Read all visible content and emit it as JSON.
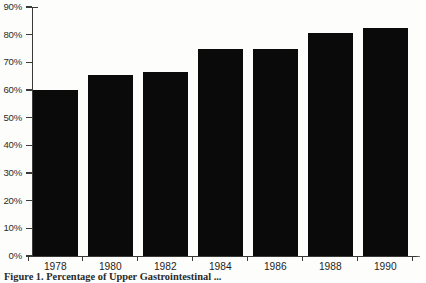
{
  "figure": {
    "caption_label": "Figure 1.",
    "caption_text": "Percentage of Upper Gastrointestinal ... ",
    "caption_full": "Figure 1.  Percentage of Upper Gastrointestinal"
  },
  "chart_data": {
    "type": "bar",
    "title": "",
    "xlabel": "",
    "ylabel": "",
    "categories": [
      "1978",
      "1980",
      "1982",
      "1984",
      "1986",
      "1988",
      "1990"
    ],
    "values": [
      60,
      65.5,
      66.5,
      75,
      75,
      80.5,
      82.5
    ],
    "value_labels": [
      "60%",
      "65.5%",
      "66.5%",
      "75%",
      "75%",
      "80.5%",
      "82.5%"
    ],
    "ylim": [
      0,
      90
    ],
    "ytick_values": [
      0,
      10,
      20,
      30,
      40,
      50,
      60,
      70,
      80,
      90
    ],
    "ytick_labels": [
      "0%",
      "10%",
      "20%",
      "30%",
      "40%",
      "50%",
      "60%",
      "70%",
      "80%",
      "90%"
    ],
    "grid": false,
    "legend": null,
    "legend_position": "none",
    "series": [
      {
        "name": "percentage",
        "values": [
          60,
          65.5,
          66.5,
          75,
          75,
          80.5,
          82.5
        ]
      }
    ],
    "bar_color": "#0a0a0a",
    "axis_color": "#3a3a38",
    "background_color": "#fdfdfb"
  }
}
